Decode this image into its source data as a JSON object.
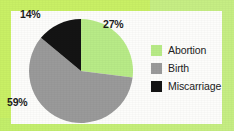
{
  "figure": {
    "width": 234,
    "height": 131,
    "border_color": "#c9f065",
    "panel_color": "#fdfdfb"
  },
  "chart_data": {
    "type": "pie",
    "title": "",
    "subtitle": "",
    "xlabel": "",
    "ylabel": "",
    "legend_position": "right",
    "grid": false,
    "start_angle_deg": 0,
    "direction": "clockwise",
    "categories": [
      "Abortion",
      "Birth",
      "Miscarriage"
    ],
    "values": [
      27,
      59,
      14
    ],
    "value_unit": "%",
    "colors": [
      "#b8eb87",
      "#9a9a9a",
      "#141414"
    ],
    "slices": [
      {
        "label": "Abortion",
        "value": 27,
        "display": "27%",
        "color": "#b8eb87",
        "start_deg": 0,
        "end_deg": 97.2
      },
      {
        "label": "Birth",
        "value": 59,
        "display": "59%",
        "color": "#9a9a9a",
        "start_deg": 97.2,
        "end_deg": 309.6
      },
      {
        "label": "Miscarriage",
        "value": 14,
        "display": "14%",
        "color": "#141414",
        "start_deg": 309.6,
        "end_deg": 360
      }
    ],
    "data_labels": [
      {
        "text": "14%",
        "slice": "Miscarriage"
      },
      {
        "text": "27%",
        "slice": "Abortion"
      },
      {
        "text": "59%",
        "slice": "Birth"
      }
    ]
  },
  "legend": {
    "items": [
      {
        "label": "Abortion",
        "color": "#b8eb87"
      },
      {
        "label": "Birth",
        "color": "#9a9a9a"
      },
      {
        "label": "Miscarriage",
        "color": "#141414"
      }
    ]
  }
}
